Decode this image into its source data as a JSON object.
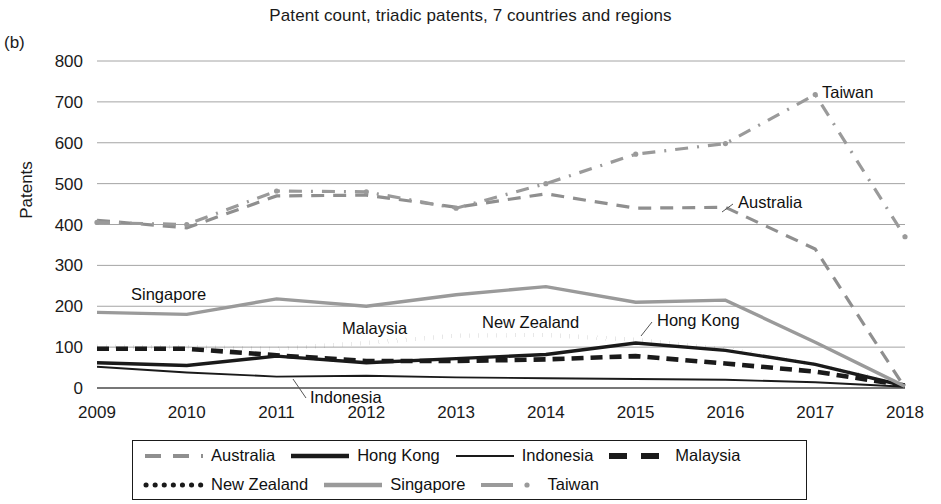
{
  "panel_label": "(b)",
  "y_axis_title": "Patents",
  "legend": {
    "items": [
      {
        "label": "Australia",
        "style": "long-dash",
        "color": "#8f8f8f"
      },
      {
        "label": "Hong Kong",
        "style": "solid-thick",
        "color": "#1a1a1a"
      },
      {
        "label": "Indonesia",
        "style": "solid-thin",
        "color": "#1a1a1a"
      },
      {
        "label": "Malaysia",
        "style": "dash-thick",
        "color": "#1a1a1a"
      },
      {
        "label": "New Zealand",
        "style": "dotted",
        "color": "#1a1a1a"
      },
      {
        "label": "Singapore",
        "style": "solid-gray",
        "color": "#9a9a9a"
      },
      {
        "label": "Taiwan",
        "style": "dash-dot",
        "color": "#9a9a9a"
      }
    ]
  },
  "annotations": [
    {
      "label": "Taiwan",
      "x": 822,
      "y": 98
    },
    {
      "label": "Australia",
      "x": 738,
      "y": 208
    },
    {
      "label": "Singapore",
      "x": 131,
      "y": 300
    },
    {
      "label": "Malaysia",
      "x": 342,
      "y": 334
    },
    {
      "label": "New Zealand",
      "x": 482,
      "y": 328
    },
    {
      "label": "Hong Kong",
      "x": 657,
      "y": 326
    },
    {
      "label": "Indonesia",
      "x": 310,
      "y": 403
    }
  ],
  "chart_data": {
    "type": "line",
    "title": "Patent count, triadic patents, 7 countries and regions",
    "xlabel": "",
    "ylabel": "Patents",
    "x": [
      2009,
      2010,
      2011,
      2012,
      2013,
      2014,
      2015,
      2016,
      2017,
      2018
    ],
    "xtick_labels": [
      "2009",
      "2010",
      "2011",
      "2012",
      "2013",
      "2014",
      "2015",
      "2016",
      "2017",
      "2018"
    ],
    "ytick_labels": [
      "0",
      "100",
      "200",
      "300",
      "400",
      "500",
      "600",
      "700",
      "800"
    ],
    "ylim": [
      0,
      800
    ],
    "ytick_step": 100,
    "grid": true,
    "legend_position": "bottom",
    "series": [
      {
        "name": "Australia",
        "color": "#8f8f8f",
        "values": [
          410,
          392,
          470,
          472,
          442,
          475,
          440,
          442,
          340,
          0
        ]
      },
      {
        "name": "Hong Kong",
        "color": "#1a1a1a",
        "values": [
          62,
          55,
          78,
          62,
          72,
          82,
          110,
          92,
          58,
          5
        ]
      },
      {
        "name": "Indonesia",
        "color": "#1a1a1a",
        "values": [
          52,
          38,
          28,
          30,
          26,
          24,
          22,
          20,
          14,
          3
        ]
      },
      {
        "name": "Malaysia",
        "color": "#1a1a1a",
        "values": [
          96,
          96,
          80,
          66,
          66,
          70,
          78,
          60,
          40,
          6
        ]
      },
      {
        "name": "New Zealand",
        "color": "#1a1a1a",
        "values": [
          101,
          100,
          96,
          110,
          128,
          130,
          118,
          96,
          58,
          8
        ]
      },
      {
        "name": "Singapore",
        "color": "#9a9a9a",
        "values": [
          185,
          180,
          218,
          200,
          228,
          248,
          210,
          215,
          112,
          4
        ]
      },
      {
        "name": "Taiwan",
        "color": "#9a9a9a",
        "values": [
          405,
          400,
          482,
          480,
          440,
          500,
          572,
          598,
          718,
          370
        ]
      }
    ]
  }
}
